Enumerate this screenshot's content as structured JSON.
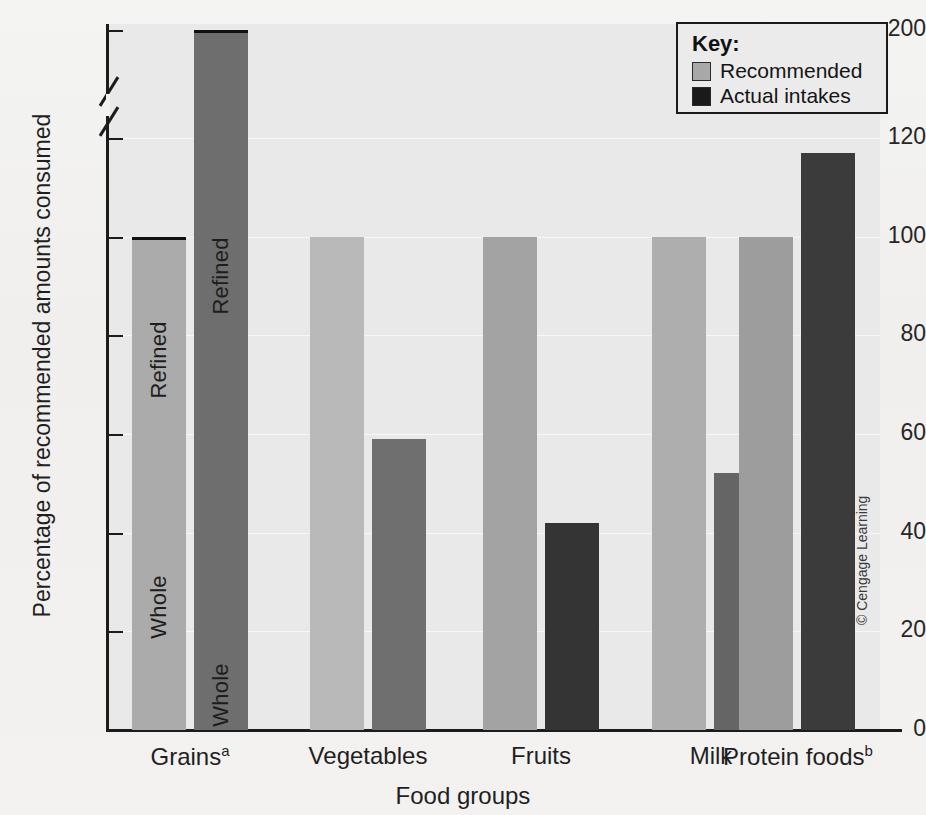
{
  "chart_data": {
    "type": "bar",
    "title": "",
    "xlabel": "Food groups",
    "ylabel": "Percentage of recommended amounts consumed",
    "ylim": [
      0,
      200
    ],
    "yticks": [
      0,
      20,
      40,
      60,
      80,
      100,
      120,
      200
    ],
    "ytick_labels": [
      "0",
      "20",
      "40",
      "60",
      "80",
      "100",
      "120",
      "200"
    ],
    "axis_break": {
      "present": true,
      "below": 120,
      "above": 200
    },
    "grid": true,
    "legend_position": "top-right",
    "categories": [
      "Grains",
      "Vegetables",
      "Fruits",
      "Milk",
      "Protein foods"
    ],
    "category_labels": [
      "Grainsᵃ",
      "Vegetables",
      "Fruits",
      "Milk",
      "Protein foodsᵇ"
    ],
    "category_footnote_marks": [
      "a",
      "",
      "",
      "",
      "b"
    ],
    "series": [
      {
        "name": "Recommended",
        "color": "#a8a8a8",
        "values": [
          100,
          100,
          100,
          100,
          100
        ]
      },
      {
        "name": "Actual intakes",
        "color": "#4a4a4a",
        "values": [
          200,
          59,
          42,
          52,
          117
        ]
      }
    ],
    "stacked_segments": {
      "Grains": {
        "Recommended": [
          {
            "label": "Whole",
            "from": 0,
            "to": 50
          },
          {
            "label": "Refined",
            "from": 50,
            "to": 100
          }
        ],
        "Actual intakes": [
          {
            "label": "Whole",
            "from": 0,
            "to": 14
          },
          {
            "label": "Refined",
            "from": 14,
            "to": 200
          }
        ]
      }
    }
  },
  "legend": {
    "title": "Key:",
    "entries": [
      {
        "label": "Recommended",
        "color": "#a8a8a8"
      },
      {
        "label": "Actual intakes",
        "color": "#1a1a1a"
      }
    ]
  },
  "credit": "© Cengage Learning",
  "colors": {
    "plot_background": "#e9e9e9",
    "page_background": "#f2f2f0",
    "axis": "#1c1c1c",
    "recommended_light": "#b4b4b4",
    "recommended_mid": "#a0a0a0",
    "actual_dark": "#696969",
    "actual_darker": "#333333",
    "gridline": "#f7f7f7"
  }
}
